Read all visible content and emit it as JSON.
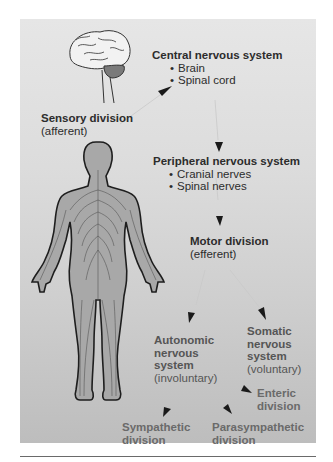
{
  "diagram": {
    "type": "nervous-system-hierarchy",
    "colors": {
      "panel_top": "#e6e6e6",
      "panel_bottom": "#bdbdbd",
      "text_dark": "#2c2c2c",
      "text_light": "#6a6a6a"
    },
    "nodes": {
      "cns": {
        "title": "Central nervous system",
        "items": [
          "Brain",
          "Spinal cord"
        ]
      },
      "sensory": {
        "title": "Sensory division",
        "sub": "(afferent)"
      },
      "pns": {
        "title": "Peripheral nervous system",
        "items": [
          "Cranial nerves",
          "Spinal nerves"
        ]
      },
      "motor": {
        "title": "Motor division",
        "sub": "(efferent)"
      },
      "autonomic": {
        "lines": [
          "Autonomic",
          "nervous",
          "system"
        ],
        "sub": "(involuntary)"
      },
      "somatic": {
        "lines": [
          "Somatic",
          "nervous",
          "system"
        ],
        "sub": "(voluntary)"
      },
      "enteric": {
        "lines": [
          "Enteric",
          "division"
        ]
      },
      "sympathetic": {
        "lines": [
          "Sympathetic",
          "division"
        ]
      },
      "parasympathetic": {
        "lines": [
          "Parasympathetic",
          "division"
        ]
      }
    },
    "edges": [
      [
        "sensory",
        "cns"
      ],
      [
        "cns",
        "pns"
      ],
      [
        "pns",
        "motor"
      ],
      [
        "motor",
        "autonomic"
      ],
      [
        "motor",
        "somatic"
      ],
      [
        "autonomic",
        "sympathetic"
      ],
      [
        "autonomic",
        "parasympathetic"
      ],
      [
        "autonomic",
        "enteric"
      ]
    ],
    "illustrations": [
      "brain",
      "human-body-nerves"
    ]
  }
}
